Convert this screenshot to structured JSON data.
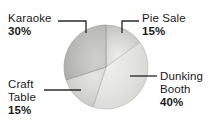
{
  "chart_data": {
    "type": "pie",
    "title": "",
    "subtitle": "",
    "xlabel": "",
    "ylabel": "",
    "grid": false,
    "legend_position": "callout-labels",
    "start_angle_deg": 0,
    "direction": "clockwise",
    "categories": [
      "Pie Sale",
      "Dunking Booth",
      "Craft Table",
      "Karaoke"
    ],
    "values": [
      15,
      40,
      15,
      30
    ],
    "unit": "%",
    "slices": [
      {
        "label": "Pie Sale",
        "value": 15,
        "value_text": "15%",
        "color": "#c9c9c9",
        "start_deg": 0,
        "end_deg": 54
      },
      {
        "label": "Dunking Booth",
        "value": 40,
        "value_text": "40%",
        "color": "#dededa",
        "start_deg": 54,
        "end_deg": 198
      },
      {
        "label": "Craft Table",
        "value": 15,
        "value_text": "15%",
        "color": "#cdcdc9",
        "start_deg": 198,
        "end_deg": 252
      },
      {
        "label": "Karaoke",
        "value": 30,
        "value_text": "30%",
        "color": "#b5b5b1",
        "start_deg": 252,
        "end_deg": 360
      }
    ]
  },
  "labels": {
    "karaoke": {
      "name": "Karaoke",
      "pct": "30%"
    },
    "pie_sale": {
      "name": "Pie Sale",
      "pct": "15%"
    },
    "craft_table": {
      "name_line1": "Craft",
      "name_line2": "Table",
      "pct": "15%"
    },
    "dunking_booth": {
      "name_line1": "Dunking",
      "name_line2": "Booth",
      "pct": "40%"
    }
  },
  "colors": {
    "background": "#ffffff",
    "text": "#1a1a1a",
    "leader_line": "#2b2b2b",
    "pie_edge": "#9a9a96"
  }
}
